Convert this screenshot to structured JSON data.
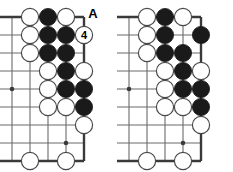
{
  "figure": {
    "title": "Go board problem diagram pair",
    "type": "go-diagram",
    "width": 233,
    "height": 172,
    "background_color": "#ffffff",
    "line_color": "#6b6b6b",
    "edge_color": "#3a3a3a",
    "black_stone_color": "#1a1a1a",
    "white_stone_color": "#ffffff",
    "white_stone_border_color": "#4a4a4a",
    "label_color": "#000000"
  },
  "geometry": {
    "grid_spacing": 18,
    "stone_radius": 8.6,
    "columns": 5,
    "rows": 9,
    "left_board_origin_x": 12,
    "right_board_origin_x": 129,
    "origin_y": 17
  },
  "boards": [
    {
      "id": "left-board",
      "name": "left-diagram",
      "caption": "Diagram 1",
      "edge_side": "right",
      "star_points": [
        {
          "col": 1,
          "row": 5
        },
        {
          "col": 4,
          "row": 8
        }
      ],
      "stones": [
        {
          "col": 2,
          "row": 1,
          "color": "white"
        },
        {
          "col": 3,
          "row": 1,
          "color": "black"
        },
        {
          "col": 4,
          "row": 1,
          "color": "white"
        },
        {
          "col": 2,
          "row": 2,
          "color": "white"
        },
        {
          "col": 3,
          "row": 2,
          "color": "black"
        },
        {
          "col": 4,
          "row": 2,
          "color": "black"
        },
        {
          "col": 5,
          "row": 2,
          "color": "white",
          "label": "4",
          "marked": true
        },
        {
          "col": 2,
          "row": 3,
          "color": "white"
        },
        {
          "col": 3,
          "row": 3,
          "color": "black"
        },
        {
          "col": 4,
          "row": 3,
          "color": "black"
        },
        {
          "col": 3,
          "row": 4,
          "color": "white"
        },
        {
          "col": 4,
          "row": 4,
          "color": "black"
        },
        {
          "col": 5,
          "row": 4,
          "color": "white"
        },
        {
          "col": 3,
          "row": 5,
          "color": "white"
        },
        {
          "col": 4,
          "row": 5,
          "color": "black"
        },
        {
          "col": 5,
          "row": 5,
          "color": "black"
        },
        {
          "col": 3,
          "row": 6,
          "color": "white"
        },
        {
          "col": 4,
          "row": 6,
          "color": "white"
        },
        {
          "col": 5,
          "row": 6,
          "color": "black"
        },
        {
          "col": 5,
          "row": 7,
          "color": "white"
        },
        {
          "col": 2,
          "row": 9,
          "color": "white"
        },
        {
          "col": 4,
          "row": 9,
          "color": "white"
        }
      ],
      "annotations": [
        {
          "text": "A",
          "col": 5,
          "row": 1,
          "offset_x": 9,
          "offset_y": -3
        }
      ]
    },
    {
      "id": "right-board",
      "name": "right-diagram",
      "caption": "Diagram 2",
      "edge_side": "right",
      "star_points": [
        {
          "col": 1,
          "row": 5
        },
        {
          "col": 4,
          "row": 8
        }
      ],
      "stones": [
        {
          "col": 2,
          "row": 1,
          "color": "white"
        },
        {
          "col": 3,
          "row": 1,
          "color": "black"
        },
        {
          "col": 4,
          "row": 1,
          "color": "white"
        },
        {
          "col": 2,
          "row": 2,
          "color": "white"
        },
        {
          "col": 3,
          "row": 2,
          "color": "black"
        },
        {
          "col": 5,
          "row": 2,
          "color": "black"
        },
        {
          "col": 2,
          "row": 3,
          "color": "white"
        },
        {
          "col": 3,
          "row": 3,
          "color": "black"
        },
        {
          "col": 4,
          "row": 3,
          "color": "black"
        },
        {
          "col": 3,
          "row": 4,
          "color": "white"
        },
        {
          "col": 4,
          "row": 4,
          "color": "black"
        },
        {
          "col": 5,
          "row": 4,
          "color": "white"
        },
        {
          "col": 3,
          "row": 5,
          "color": "white"
        },
        {
          "col": 4,
          "row": 5,
          "color": "black"
        },
        {
          "col": 5,
          "row": 5,
          "color": "black"
        },
        {
          "col": 3,
          "row": 6,
          "color": "white"
        },
        {
          "col": 4,
          "row": 6,
          "color": "white"
        },
        {
          "col": 5,
          "row": 6,
          "color": "black"
        },
        {
          "col": 5,
          "row": 7,
          "color": "white"
        },
        {
          "col": 2,
          "row": 9,
          "color": "white"
        },
        {
          "col": 4,
          "row": 9,
          "color": "white"
        }
      ],
      "annotations": []
    }
  ]
}
